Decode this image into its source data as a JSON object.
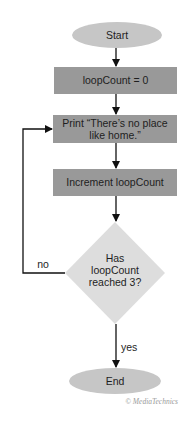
{
  "flowchart": {
    "nodes": [
      {
        "id": "start",
        "type": "terminal",
        "label": "Start"
      },
      {
        "id": "init",
        "type": "process",
        "label": "loopCount = 0"
      },
      {
        "id": "print",
        "type": "process",
        "lines": [
          "Print “There’s no place",
          "like home.”"
        ]
      },
      {
        "id": "increment",
        "type": "process",
        "label": "Increment loopCount"
      },
      {
        "id": "decision",
        "type": "decision",
        "lines": [
          "Has",
          "loopCount",
          "reached 3?"
        ]
      },
      {
        "id": "end",
        "type": "terminal",
        "label": "End"
      }
    ],
    "edges": [
      {
        "from": "start",
        "to": "init",
        "label": ""
      },
      {
        "from": "init",
        "to": "print",
        "label": ""
      },
      {
        "from": "print",
        "to": "increment",
        "label": ""
      },
      {
        "from": "increment",
        "to": "decision",
        "label": ""
      },
      {
        "from": "decision",
        "to": "print",
        "label": "no"
      },
      {
        "from": "decision",
        "to": "end",
        "label": "yes"
      }
    ],
    "labels": {
      "no": "no",
      "yes": "yes"
    }
  },
  "credit": "© MediaTechnics",
  "colors": {
    "terminal": "#c6c6c6",
    "process": "#999999",
    "decision": "#dddddd",
    "line": "#111111",
    "text": "#1e1e1e"
  }
}
